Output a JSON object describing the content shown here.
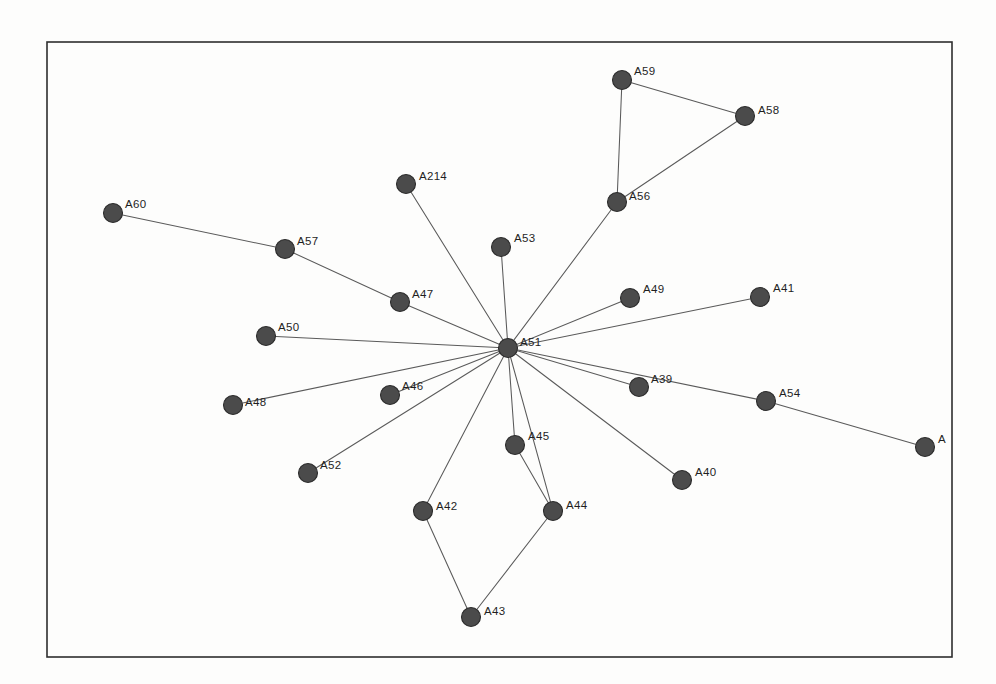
{
  "figure": {
    "background_color": "#fdfdfc",
    "frame": {
      "x": 47,
      "y": 42,
      "width": 905,
      "height": 615,
      "color": "#2e2e2e"
    },
    "node_color": "#4b4b4b",
    "node_outline_color": "#2c2c2c",
    "edge_color": "#5a5a5a",
    "label_color": "#1f1f1f",
    "node_radius": 9.5
  },
  "chart_data": {
    "type": "scatter",
    "title": "",
    "xlabel": "",
    "ylabel": "",
    "grid": false,
    "legend": "none",
    "layout": "star / hub-and-spoke network with central hub A51",
    "nodes": [
      {
        "id": "A60",
        "label": "A60",
        "x": 113,
        "y": 213,
        "label_dx": 12,
        "label_dy": -5
      },
      {
        "id": "A57",
        "label": "A57",
        "x": 285,
        "y": 249,
        "label_dx": 12,
        "label_dy": -4
      },
      {
        "id": "A47",
        "label": "A47",
        "x": 400,
        "y": 302,
        "label_dx": 12,
        "label_dy": -4
      },
      {
        "id": "A50",
        "label": "A50",
        "x": 266,
        "y": 336,
        "label_dx": 12,
        "label_dy": -5
      },
      {
        "id": "A48",
        "label": "A48",
        "x": 233,
        "y": 405,
        "label_dx": 12,
        "label_dy": 1
      },
      {
        "id": "A46",
        "label": "A46",
        "x": 390,
        "y": 395,
        "label_dx": 12,
        "label_dy": -5
      },
      {
        "id": "A52",
        "label": "A52",
        "x": 308,
        "y": 473,
        "label_dx": 12,
        "label_dy": -4
      },
      {
        "id": "A214",
        "label": "A214",
        "x": 406,
        "y": 184,
        "label_dx": 13,
        "label_dy": -4
      },
      {
        "id": "A53",
        "label": "A53",
        "x": 501,
        "y": 247,
        "label_dx": 13,
        "label_dy": -5
      },
      {
        "id": "A51",
        "label": "A51",
        "x": 508,
        "y": 348,
        "label_dx": 12,
        "label_dy": -2
      },
      {
        "id": "A59",
        "label": "A59",
        "x": 622,
        "y": 80,
        "label_dx": 12,
        "label_dy": -5
      },
      {
        "id": "A58",
        "label": "A58",
        "x": 745,
        "y": 116,
        "label_dx": 13,
        "label_dy": -2
      },
      {
        "id": "A56",
        "label": "A56",
        "x": 617,
        "y": 202,
        "label_dx": 12,
        "label_dy": -2
      },
      {
        "id": "A49",
        "label": "A49",
        "x": 630,
        "y": 298,
        "label_dx": 13,
        "label_dy": -5
      },
      {
        "id": "A41",
        "label": "A41",
        "x": 760,
        "y": 297,
        "label_dx": 13,
        "label_dy": -5
      },
      {
        "id": "A39",
        "label": "A39",
        "x": 639,
        "y": 387,
        "label_dx": 12,
        "label_dy": -4
      },
      {
        "id": "A54",
        "label": "A54",
        "x": 766,
        "y": 401,
        "label_dx": 13,
        "label_dy": -4
      },
      {
        "id": "A55",
        "label": "A",
        "x": 925,
        "y": 447,
        "label_dx": 13,
        "label_dy": -4
      },
      {
        "id": "A40",
        "label": "A40",
        "x": 682,
        "y": 480,
        "label_dx": 13,
        "label_dy": -4
      },
      {
        "id": "A45",
        "label": "A45",
        "x": 515,
        "y": 445,
        "label_dx": 13,
        "label_dy": -5
      },
      {
        "id": "A42",
        "label": "A42",
        "x": 423,
        "y": 511,
        "label_dx": 13,
        "label_dy": -1
      },
      {
        "id": "A44",
        "label": "A44",
        "x": 553,
        "y": 511,
        "label_dx": 13,
        "label_dy": -2
      },
      {
        "id": "A43",
        "label": "A43",
        "x": 471,
        "y": 617,
        "label_dx": 13,
        "label_dy": -2
      }
    ],
    "edges": [
      {
        "source": "A60",
        "target": "A57"
      },
      {
        "source": "A57",
        "target": "A47"
      },
      {
        "source": "A47",
        "target": "A51"
      },
      {
        "source": "A50",
        "target": "A51"
      },
      {
        "source": "A48",
        "target": "A51"
      },
      {
        "source": "A46",
        "target": "A51"
      },
      {
        "source": "A52",
        "target": "A51"
      },
      {
        "source": "A214",
        "target": "A51"
      },
      {
        "source": "A53",
        "target": "A51"
      },
      {
        "source": "A56",
        "target": "A51"
      },
      {
        "source": "A59",
        "target": "A56"
      },
      {
        "source": "A59",
        "target": "A58"
      },
      {
        "source": "A58",
        "target": "A56"
      },
      {
        "source": "A49",
        "target": "A51"
      },
      {
        "source": "A41",
        "target": "A51"
      },
      {
        "source": "A39",
        "target": "A51"
      },
      {
        "source": "A54",
        "target": "A51"
      },
      {
        "source": "A55",
        "target": "A54"
      },
      {
        "source": "A40",
        "target": "A51"
      },
      {
        "source": "A45",
        "target": "A51"
      },
      {
        "source": "A45",
        "target": "A44"
      },
      {
        "source": "A42",
        "target": "A51"
      },
      {
        "source": "A44",
        "target": "A51"
      },
      {
        "source": "A42",
        "target": "A43"
      },
      {
        "source": "A44",
        "target": "A43"
      }
    ],
    "hub": "A51",
    "hub_degree": 16
  }
}
